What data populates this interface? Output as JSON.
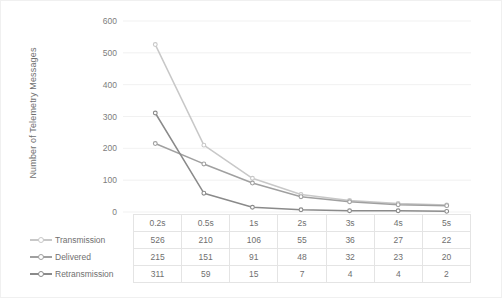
{
  "chart_data": {
    "type": "line",
    "title": "",
    "xlabel": "",
    "ylabel": "Number of Telemetry Messages",
    "categories": [
      "0.2s",
      "0.5s",
      "1s",
      "2s",
      "3s",
      "4s",
      "5s"
    ],
    "ylim": [
      0,
      600
    ],
    "yticks": [
      0,
      100,
      200,
      300,
      400,
      500,
      600
    ],
    "ytick_labels": [
      "0",
      "100",
      "200",
      "300",
      "400",
      "500",
      "600"
    ],
    "grid": true,
    "legend_position": "table-left",
    "series": [
      {
        "name": "Transmission",
        "values": [
          526,
          210,
          106,
          55,
          36,
          27,
          22
        ],
        "color": "#c8c8c8"
      },
      {
        "name": "Delivered",
        "values": [
          215,
          151,
          91,
          48,
          32,
          23,
          20
        ],
        "color": "#a0a0a0"
      },
      {
        "name": "Retransmission",
        "values": [
          311,
          59,
          15,
          7,
          4,
          4,
          2
        ],
        "color": "#8a8a8a"
      }
    ]
  },
  "table": {
    "header_label": "",
    "columns": [
      "0.2s",
      "0.5s",
      "1s",
      "2s",
      "3s",
      "4s",
      "5s"
    ],
    "rows": [
      {
        "label": "Transmission",
        "values": [
          "526",
          "210",
          "106",
          "55",
          "36",
          "27",
          "22"
        ]
      },
      {
        "label": "Delivered",
        "values": [
          "215",
          "151",
          "91",
          "48",
          "32",
          "23",
          "20"
        ]
      },
      {
        "label": "Retransmission",
        "values": [
          "311",
          "59",
          "15",
          "7",
          "4",
          "4",
          "2"
        ]
      }
    ]
  },
  "axis": {
    "y_title": "Number of Telemetry Messages",
    "y_labels": [
      "600",
      "500",
      "400",
      "300",
      "200",
      "100",
      "0"
    ]
  },
  "colors": {
    "transmission": "#c8c8c8",
    "delivered": "#a0a0a0",
    "retransmission": "#8a8a8a",
    "grid": "#ededed",
    "text": "#6f6f6f",
    "background": "#ffffff"
  }
}
